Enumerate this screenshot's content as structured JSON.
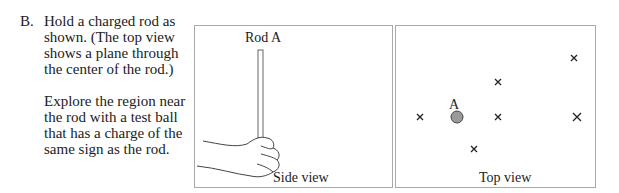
{
  "section": {
    "letter": "B.",
    "paragraph1": "Hold a charged rod as shown.  (The top view shows a plane through the center of the rod.)",
    "paragraph2": "Explore the region near the rod with a test ball that has a charge of the same sign as the rod."
  },
  "side_view": {
    "rod_label": "Rod A",
    "caption": "Side view"
  },
  "top_view": {
    "ball_label": "A",
    "caption": "Top view",
    "ball_color": "#9a9a9a",
    "markers": [
      {
        "symbol": "×",
        "x": 24,
        "y": 91
      },
      {
        "symbol": "×",
        "x": 102,
        "y": 56
      },
      {
        "symbol": "×",
        "x": 102,
        "y": 91
      },
      {
        "symbol": "×",
        "x": 78,
        "y": 123
      },
      {
        "symbol": "×",
        "x": 178,
        "y": 32
      },
      {
        "symbol": "×",
        "x": 181,
        "y": 91
      }
    ]
  }
}
